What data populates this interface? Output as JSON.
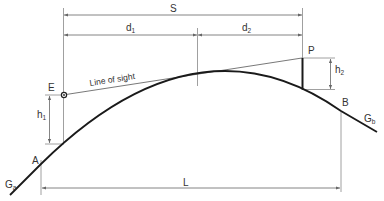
{
  "labels": {
    "S": "S",
    "d1_main": "d",
    "d1_sub": "1",
    "d2_main": "d",
    "d2_sub": "2",
    "E": "E",
    "P": "P",
    "h1_main": "h",
    "h1_sub": "1",
    "h2_main": "h",
    "h2_sub": "2",
    "A": "A",
    "B": "B",
    "Ga_main": "G",
    "Ga_sub": "a",
    "Gb_main": "G",
    "Gb_sub": "b",
    "L": "L",
    "line_of_sight": "Line of sight"
  },
  "colors": {
    "curve": "#1a1a1a",
    "dimension": "#666666",
    "text": "#333333",
    "background": "#ffffff"
  }
}
